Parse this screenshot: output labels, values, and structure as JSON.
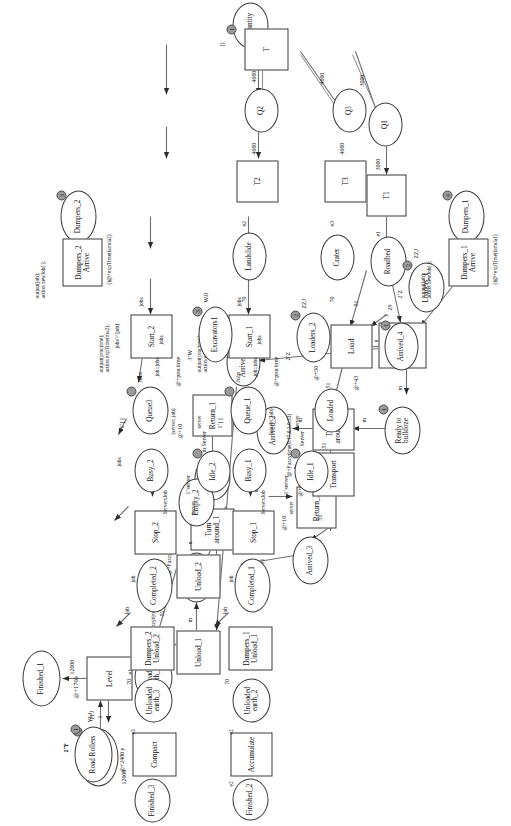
{
  "header": {
    "text": ""
  },
  "diagram": {
    "type": "coloured-petri-net",
    "places": [
      {
        "id": "Bulldozers1",
        "label": "Bulldozers1",
        "marking": "2`T",
        "colorset": "TTJ",
        "tokens": "2"
      },
      {
        "id": "Finished_1",
        "label": "Finished_1"
      },
      {
        "id": "UnloadedEarth_1",
        "label": "Unloaded\nearth_1"
      },
      {
        "id": "Empty_1",
        "label": "Empty_1"
      },
      {
        "id": "ReadyToReturn_1",
        "label": "Ready to\nreturn_1"
      },
      {
        "id": "Arrived_1",
        "label": "Arrived_1"
      },
      {
        "id": "Arrived_2",
        "label": "Arrived_2"
      },
      {
        "id": "ReadyToBulldoze",
        "label": "Ready to\nbulldoze",
        "tokens": "1"
      },
      {
        "id": "Roadbed",
        "label": "Roadbed"
      },
      {
        "id": "Empty_2",
        "label": "Empty_2"
      },
      {
        "id": "Arrived_3",
        "label": "Arrived_3"
      },
      {
        "id": "Loaded",
        "label": "Loaded"
      },
      {
        "id": "Arrived_4",
        "label": "Arrived_4",
        "tokens": "1"
      },
      {
        "id": "Loaders_1",
        "label": "Loaders_1",
        "marking": "2`Z",
        "colorset": "ZZJ",
        "tokens": "2"
      },
      {
        "id": "Q1",
        "label": "Q1"
      },
      {
        "id": "Quantity",
        "label": "Quantity",
        "marking": "()",
        "tokens": "1"
      },
      {
        "id": "Q2",
        "label": "Q2"
      },
      {
        "id": "Q3",
        "label": "Q3"
      },
      {
        "id": "Dumpers_1",
        "label": "Dumpers_1",
        "tokens": "4"
      },
      {
        "id": "Dumpers_2",
        "label": "Dumpers_2",
        "tokens": "3"
      },
      {
        "id": "Landslide",
        "label": "Landslide"
      },
      {
        "id": "Crater",
        "label": "Crater"
      },
      {
        "id": "Queue_1",
        "label": "Queue_1",
        "marking": "1`[ ]",
        "colorset": "Jobs"
      },
      {
        "id": "Queue3",
        "label": "Queue3",
        "marking": "1`[ ]",
        "colorset": "Jobs"
      },
      {
        "id": "Busy_1",
        "label": "Busy_1"
      },
      {
        "id": "Busy_2",
        "label": "Busy_2"
      },
      {
        "id": "Idle_1",
        "label": "Idle_1",
        "marking": "1`server",
        "colorset": "Server"
      },
      {
        "id": "Idle_2",
        "label": "Idle_2",
        "marking": "1`server",
        "colorset": "Server"
      },
      {
        "id": "Loaders_2",
        "label": "Loaders_2",
        "marking": "2`Z",
        "colorset": "ZZJ",
        "tokens": "2"
      },
      {
        "id": "Excavators1",
        "label": "Excavators1",
        "marking": "3`W",
        "colorset": "WJJ",
        "tokens": "3"
      },
      {
        "id": "Completed_1",
        "label": "Completed_1"
      },
      {
        "id": "Completed_2",
        "label": "Completed_2"
      },
      {
        "id": "UnloadedEarth_2",
        "label": "Unloaded\nearth_2"
      },
      {
        "id": "UnloadedEarth_3",
        "label": "Unloaded\nearth_3"
      },
      {
        "id": "Finished_2",
        "label": "Finished_2"
      },
      {
        "id": "Finished_3",
        "label": "Finished_3"
      },
      {
        "id": "RoadRollers",
        "label": "Road Rollers",
        "marking": "1`Y",
        "colorset": "YLJ",
        "tokens": "1"
      }
    ],
    "transitions": [
      {
        "id": "Level",
        "label": "Level",
        "time": "@+1700"
      },
      {
        "id": "Unload_1",
        "label": "Unload_1",
        "time": "@+Fuzzytime(0.2,0.3,0.35)"
      },
      {
        "id": "Unload_2",
        "label": "Unload_2"
      },
      {
        "id": "TurnAround_1",
        "label": "Turn\naround_1",
        "time": "@+Fuzzytime(0.17,0.2,0.33)"
      },
      {
        "id": "Return_1",
        "label": "Return_1",
        "time": "@+10"
      },
      {
        "id": "TurnAround_2",
        "label": "Turn\naround_2",
        "time": "@+Fuzzytime(0.17,0.2,0.33)"
      },
      {
        "id": "Bulldoze",
        "label": "Bulldoze",
        "time": "@+43"
      },
      {
        "id": "Transport",
        "label": "Transport",
        "time": "@+43"
      },
      {
        "id": "Return_2",
        "label": "Return_2",
        "time": "@+10"
      },
      {
        "id": "Load",
        "label": "Load",
        "time": "@+50"
      },
      {
        "id": "T1",
        "label": "T1"
      },
      {
        "id": "T",
        "label": "T"
      },
      {
        "id": "T2",
        "label": "T2"
      },
      {
        "id": "T3",
        "label": "T3"
      },
      {
        "id": "DumpersArrive_1",
        "label": "Dumpers_1\nArrive",
        "time": "()@+expTime(lamda1)",
        "code": "output(job);\naction newJob( );"
      },
      {
        "id": "DumpersArrive_2",
        "label": "Dumpers_2\nArrive",
        "time": "()@+expTime(lamda2)",
        "code": "output(job);\naction newJob( );"
      },
      {
        "id": "Start_1",
        "label": "Start_1",
        "time": "@+proctime",
        "code": "output(proctime);\naction expTime(mu1);"
      },
      {
        "id": "Start_2",
        "label": "Start_2",
        "time": "@+proctime",
        "code": "output(proctime);\naction expTime(mu2);"
      },
      {
        "id": "Stop_1",
        "label": "Stop_1"
      },
      {
        "id": "Stop_2",
        "label": "Stop_2"
      },
      {
        "id": "DumpersUnload_1",
        "label": "Dumpers_1\nUnload_1"
      },
      {
        "id": "DumpersUnload_2",
        "label": "Dumpers_2\nUnload_2"
      },
      {
        "id": "Accumulate",
        "label": "Accumulate"
      },
      {
        "id": "Compact",
        "label": "Compact",
        "time": "@+2400"
      }
    ],
    "arc_labels": {
      "a_bulldozers_level": "1",
      "a_level_finished1": "12000",
      "a_ue1_level": "e1",
      "a_unload1_ue1": "29",
      "a_unload2_ue1": "51",
      "a_unload1_empty1": "m",
      "a_turn1_empty1": "m",
      "a_ready1_turn1": "m",
      "a_return1_ready1": "m",
      "a_arrived2_return1": "m",
      "a_turn2_arrived2": "m",
      "a_readybulldoze_turn2": "m",
      "a_bulldoze_ready": "m",
      "a_bulldozers_bulldoze": "1",
      "a_roadbed_bulldoze": "29",
      "a_bulldoze_arrived1": "29",
      "a_arrived1_unload1": "29",
      "a_unload2_empty2": "n",
      "a_empty2_return2": "n",
      "a_return2_arrived3": "n",
      "a_arrived3_unload2": "51",
      "a_transport_arrived3": "51",
      "a_loaded_transport": "51",
      "a_load_loaded": "51",
      "a_roadbed_load": "51",
      "a_load_arrived4": "n",
      "a_loaders_load": "z",
      "a_load_loaders": "2`Z",
      "a_T1_roadbed": "e1",
      "a_Q1_T1": "3000",
      "a_T_Q1": "3000",
      "a_T_Q2": "4000",
      "a_Q2_T2": "4000",
      "a_T_Q3": "4000",
      "a_Q3_T3": "4000",
      "a_T2_landslide": "e2",
      "a_T3_crater": "e3",
      "a_landslide_start1": "70",
      "a_crater_start2": "70",
      "a_queue_jobs": "jobs",
      "a_jobs_job": "jobs^^[job]",
      "a_jobjobs": "job::jobs",
      "a_server_job": "(server, job)",
      "a_serverjob": "ServerxJob",
      "a_server": "server",
      "a_job": "job",
      "a_Job": "Job",
      "a_jobs": "jobs",
      "a_unload70": "70",
      "a_ue2_acc": "e2",
      "a_acc_fin2": "e2",
      "a_ue3_compact": "e3",
      "a_compact_fin3": "12000",
      "a_roller_compact": "y",
      "a_dumper1_unload": "job"
    }
  }
}
